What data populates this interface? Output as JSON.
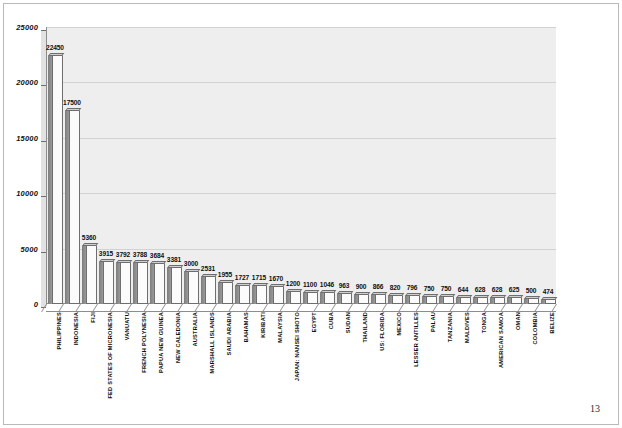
{
  "page": {
    "page_number": "13"
  },
  "chart_data": {
    "type": "bar",
    "title": "",
    "xlabel": "",
    "ylabel": "",
    "ylim": [
      0,
      25000
    ],
    "ytick_labels": [
      "0",
      "5000",
      "10000",
      "15000",
      "20000",
      "25000"
    ],
    "ytick_values": [
      0,
      5000,
      10000,
      15000,
      20000,
      25000
    ],
    "grid": true,
    "legend": "none",
    "orientation": "vertical",
    "style": "3d-bar",
    "categories": [
      "PHILIPPINES",
      "INDONESIA",
      "FIJI",
      "FED STATES OF MICRONESIA",
      "VANUATU",
      "FRENCH POLYNESIA",
      "PAPUA NEW GUINEA",
      "NEW CALEDONIA",
      "AUSTRALIA",
      "MARSHALL ISLANDS",
      "SAUDI ARABIA",
      "BAHAMAS",
      "KIRIBATI",
      "MALAYSIA",
      "JAPAN: NANSEI SHOTO",
      "EGYPT",
      "CUBA",
      "SUDAN",
      "THAILAND",
      "US: FLORIDA",
      "MEXICO",
      "LESSER ANTILLES",
      "PALAU",
      "TANZANIA",
      "MALDIVES",
      "TONGA",
      "AMERICAN SAMOA",
      "OMAN",
      "COLOMBIA",
      "BELIZE"
    ],
    "values": [
      22450,
      17500,
      5360,
      3915,
      3792,
      3788,
      3684,
      3381,
      3000,
      2531,
      1955,
      1727,
      1715,
      1670,
      1200,
      1100,
      1046,
      963,
      900,
      866,
      820,
      796,
      750,
      750,
      644,
      628,
      628,
      625,
      500,
      474
    ],
    "value_labels": [
      "22450",
      "17500",
      "5360",
      "3915",
      "3792",
      "3788",
      "3684",
      "3381",
      "3000",
      "2531",
      "1955",
      "1727",
      "1715",
      "1670",
      "1200",
      "1100",
      "1046",
      "963",
      "900",
      "866",
      "820",
      "796",
      "750",
      "750",
      "644",
      "628",
      "628",
      "625",
      "500",
      "474"
    ],
    "colors": {
      "bar_front": "#fbfbfb",
      "bar_side": "#8a8a8a",
      "bar_outline": "#6e6e6e",
      "plot_background": "#eeeeee",
      "gridline": "#d2d2d2",
      "axis": "#8d8d8d",
      "text": "#101010"
    }
  }
}
